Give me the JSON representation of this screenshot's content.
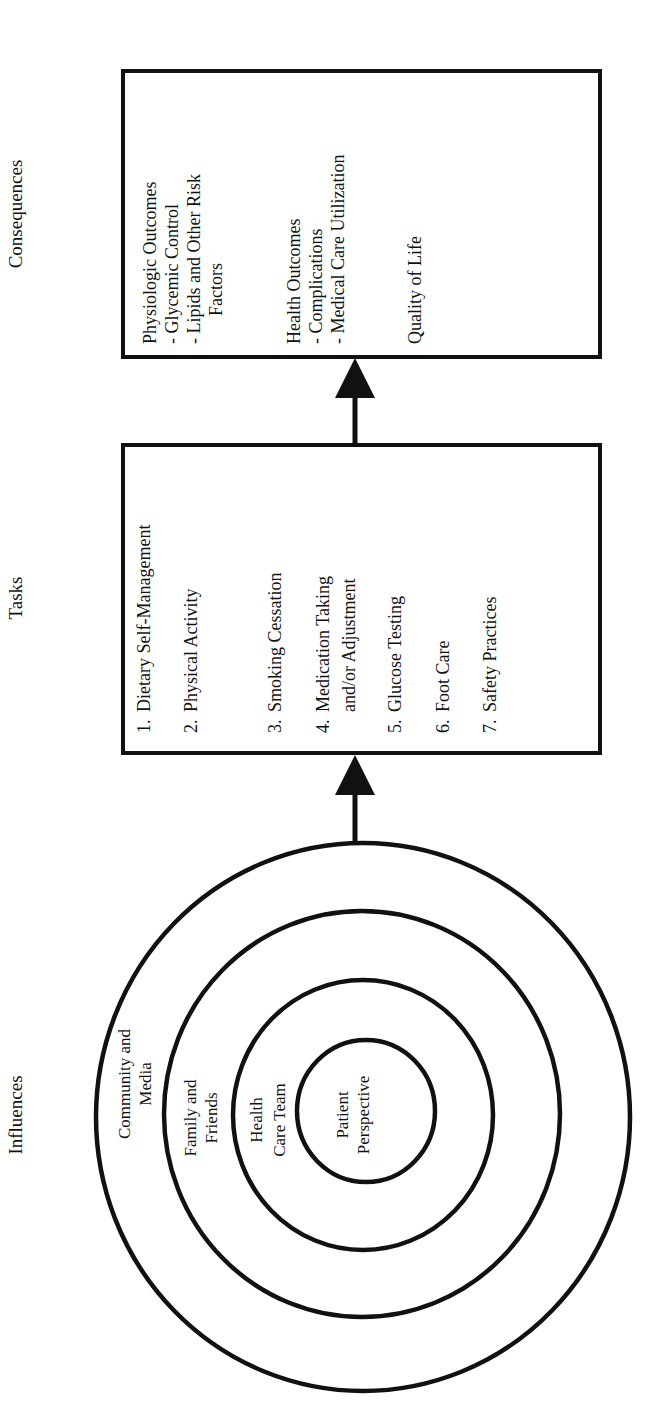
{
  "headings": {
    "consequences": "Consequences",
    "tasks": "Tasks",
    "influences": "Influences"
  },
  "consequences_box": {
    "lines": [
      {
        "text": "Physiologic Outcomes",
        "indent": 0
      },
      {
        "text": "-  Glycemic Control",
        "indent": 1
      },
      {
        "text": "-  Lipids and Other Risk",
        "indent": 1
      },
      {
        "text": "Factors",
        "indent": 2
      },
      {
        "text": "",
        "indent": 0
      },
      {
        "text": "Health Outcomes",
        "indent": 0
      },
      {
        "text": "-  Complications",
        "indent": 1
      },
      {
        "text": "-  Medical Care Utilization",
        "indent": 1
      },
      {
        "text": "",
        "indent": 0
      },
      {
        "text": "Quality of Life",
        "indent": 0
      }
    ]
  },
  "tasks_box": {
    "items": [
      {
        "num": "1.",
        "lines": [
          "Dietary Self-Management"
        ]
      },
      {
        "num": "2.",
        "lines": [
          "Physical Activity"
        ]
      },
      {
        "num": "3.",
        "lines": [
          "Smoking Cessation"
        ]
      },
      {
        "num": "4.",
        "lines": [
          "Medication Taking",
          "and/or Adjustment"
        ]
      },
      {
        "num": "5.",
        "lines": [
          "Glucose Testing"
        ]
      },
      {
        "num": "6.",
        "lines": [
          "Foot Care"
        ]
      },
      {
        "num": "7.",
        "lines": [
          "Safety Practices"
        ]
      }
    ]
  },
  "influence_rings": [
    {
      "lines": [
        "Community and",
        "Media"
      ]
    },
    {
      "lines": [
        "Family and",
        "Friends"
      ]
    },
    {
      "lines": [
        "Health",
        "Care Team"
      ]
    },
    {
      "lines": [
        "Patient",
        "Perspective"
      ]
    }
  ],
  "colors": {
    "stroke": "#111111",
    "background": "#ffffff"
  }
}
